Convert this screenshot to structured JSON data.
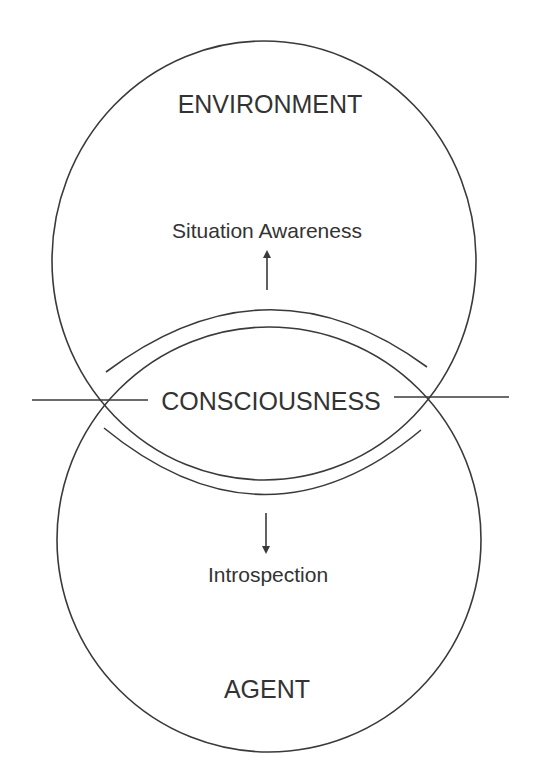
{
  "diagram": {
    "type": "venn-overlap",
    "colors": {
      "stroke": "#3a3a3a",
      "text": "#333333",
      "background": "#ffffff"
    },
    "upper_circle": {
      "label": "ENVIRONMENT",
      "inner_label": "Situation Awareness",
      "arrow_direction": "up"
    },
    "lower_circle": {
      "label": "AGENT",
      "inner_label": "Introspection",
      "arrow_direction": "down"
    },
    "intersection": {
      "label": "CONSCIOUSNESS"
    }
  }
}
